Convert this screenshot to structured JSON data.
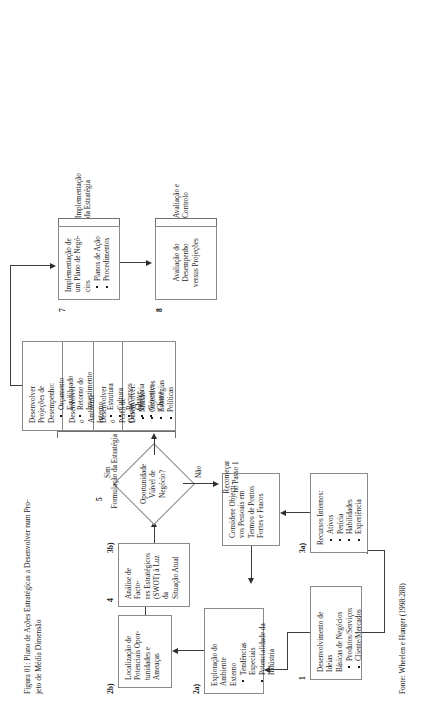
{
  "figure": {
    "caption_line1": "Figura 01: Plano de Ações Estratégicas a Desenvolver num Pro-",
    "caption_line2": "jeto de Média Dimensão",
    "source": "Fonte: Wheelen e Hunger (1998:288)"
  },
  "nodes": {
    "n1": {
      "number": "1",
      "title": "Desenvolvimento de Ideias\nBásicas de Negócios",
      "bullets": [
        "Produtos/Serviços",
        "Cliente/Mercados"
      ]
    },
    "n2a": {
      "number": "2a)",
      "title": "Exploração do Ambiente\nExterno",
      "bullets": [
        "Tendências Especiais",
        "Potencialidade da\nIndústria"
      ]
    },
    "n2b": {
      "number": "2b)",
      "title": "Localização de\nPotenciais Opor-\ntunidades e\nAmeaças",
      "bullets": []
    },
    "n3a": {
      "number": "3a)",
      "title": "Recursos Internos:",
      "bullets": [
        "Ativos",
        "Perícia",
        "Habilidades",
        "Experiência"
      ]
    },
    "n3b": {
      "number": "3b)",
      "title": "Considere Objecti-\nvos Pessoais em\nTermos de Pontos\nFortes e Fracos",
      "bullets": []
    },
    "n4": {
      "number": "4",
      "title": "Análise de Facto-\nres Estratégicos\n(SWOT) à Luz da\nSituação Atual",
      "bullets": []
    },
    "n5": {
      "number": "5",
      "title": "Oportunidade\nViável de\nNegócio?",
      "yes_label": "Sim",
      "no_label": "Não",
      "no_target": "Recomeçar\nno Passo 1"
    },
    "n6": {
      "number": "6",
      "panels": [
        {
          "title": "Desenvolver:",
          "bullets": [
            "Missão",
            "Objectivos",
            "Estratégias",
            "Políticas"
          ]
        },
        {
          "title": "Desenvolver o\nPerfil de\nGestor",
          "bullets": [
            "Diretoria",
            "Gerentes\nChave"
          ]
        },
        {
          "title": "Desenvolver o\nAmbiente\nInterno",
          "bullets": [
            "Estrutura",
            "Cultura",
            "Recursos\nChave"
          ]
        },
        {
          "title": "Desenvolver\nProjeções de\nDesempenho:",
          "bullets": [
            "Orçamento\nEquilibrado",
            "Retorno do\nInvestimento"
          ]
        }
      ]
    },
    "n7": {
      "number": "7",
      "title": "Implementação de\num Plano de Negó-\ncios",
      "bullets": [
        "Planos de Ação",
        "Procedimentos"
      ]
    },
    "n8": {
      "number": "8",
      "title": "Avaliação do\nDesempenho\nversus Projeções",
      "bullets": []
    }
  },
  "brackets": {
    "formulacao": "Formulação da Estratégia",
    "implementacao": "Implementação\nda Estratégia",
    "avaliacao": "Avaliação e\nControlo"
  }
}
